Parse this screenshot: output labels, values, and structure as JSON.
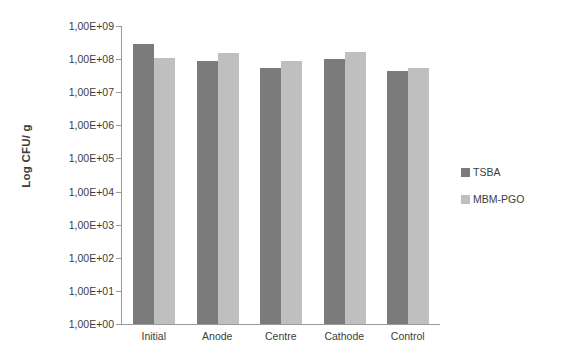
{
  "chart_data": {
    "type": "bar",
    "title": "",
    "xlabel": "",
    "ylabel": "Log CFU/ g",
    "categories": [
      "Initial",
      "Anode",
      "Centre",
      "Cathode",
      "Control"
    ],
    "series": [
      {
        "name": "TSBA",
        "color": "#7b7b7b",
        "values": [
          280000000.0,
          90000000.0,
          55000000.0,
          100000000.0,
          45000000.0
        ],
        "log_values": [
          8.45,
          7.95,
          7.74,
          8.0,
          7.65
        ]
      },
      {
        "name": "MBM-PGO",
        "color": "#bfbfbf",
        "values": [
          110000000.0,
          150000000.0,
          90000000.0,
          170000000.0,
          55000000.0
        ],
        "log_values": [
          8.04,
          8.18,
          7.95,
          8.23,
          7.74
        ]
      }
    ],
    "yscale": "log",
    "ylim": [
      1,
      1000000000
    ],
    "ytick_labels": [
      "1,00E+09",
      "1,00E+08",
      "1,00E+07",
      "1,00E+06",
      "1,00E+05",
      "1,00E+04",
      "1,00E+03",
      "1,00E+02",
      "1,00E+01",
      "1,00E+00"
    ],
    "ytick_log_values": [
      9,
      8,
      7,
      6,
      5,
      4,
      3,
      2,
      1,
      0
    ],
    "grid": false,
    "legend_position": "right",
    "legend": [
      "TSBA",
      "MBM-PGO"
    ],
    "background_color": "#ffffff",
    "axis_color": "#9a9a9a",
    "text_color": "#3c3c3c"
  }
}
